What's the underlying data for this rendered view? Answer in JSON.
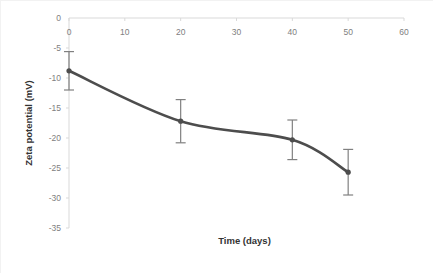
{
  "chart_data": {
    "type": "line",
    "title": "",
    "subtitle": "",
    "xlabel": "Time (days)",
    "ylabel": "Zeta potential (mV)",
    "x": [
      0,
      20,
      40,
      50
    ],
    "values": [
      -8.8,
      -17.2,
      -20.3,
      -25.7
    ],
    "errors": [
      3.2,
      3.6,
      3.3,
      3.8
    ],
    "series": [
      {
        "name": "Zeta potential",
        "x": [
          0,
          20,
          40,
          50
        ],
        "values": [
          -8.8,
          -17.2,
          -20.3,
          -25.7
        ],
        "errors": [
          3.2,
          3.6,
          3.3,
          3.8
        ],
        "color": "#4d4d4d",
        "marker": "circle",
        "smoothed": true
      }
    ],
    "xlim": [
      0,
      60
    ],
    "ylim": [
      -35,
      0
    ],
    "xticks": [
      0,
      10,
      20,
      30,
      40,
      50,
      60
    ],
    "yticks": [
      0,
      -5,
      -10,
      -15,
      -20,
      -25,
      -30,
      -35
    ],
    "xtick_labels": [
      "0",
      "10",
      "20",
      "30",
      "40",
      "50",
      "60"
    ],
    "ytick_labels": [
      "0",
      "-5",
      "-10",
      "-15",
      "-20",
      "-25",
      "-30",
      "-35"
    ],
    "grid": false,
    "legend": null,
    "legend_position": "none",
    "annotations": [],
    "axis_line_color": "#d9d9d9",
    "tick_label_color": "#808080",
    "axis_title_color": "#333333",
    "plot_background": "#ffffff",
    "border_color": "#f2f2f2"
  },
  "axes": {
    "x_title": "Time (days)",
    "y_title": "Zeta potential (mV)"
  },
  "ticks": {
    "x": [
      "0",
      "10",
      "20",
      "30",
      "40",
      "50",
      "60"
    ],
    "y": [
      "0",
      "-5",
      "-10",
      "-15",
      "-20",
      "-25",
      "-30",
      "-35"
    ]
  }
}
